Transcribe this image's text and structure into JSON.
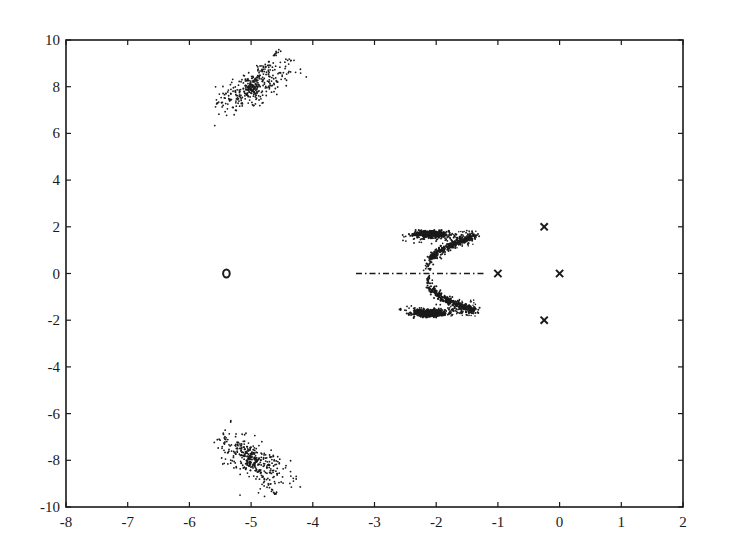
{
  "chart_data": {
    "type": "scatter",
    "title": "",
    "xlabel": "",
    "ylabel": "",
    "xlim": [
      -8,
      2
    ],
    "ylim": [
      -10,
      10
    ],
    "grid": false,
    "legend": null,
    "x_ticks": [
      -8,
      -7,
      -6,
      -5,
      -4,
      -3,
      -2,
      -1,
      0,
      1,
      2
    ],
    "y_ticks": [
      -10,
      -8,
      -6,
      -4,
      -2,
      0,
      2,
      4,
      6,
      8,
      10
    ],
    "x_tick_labels": [
      "-8",
      "-7",
      "-6",
      "-5",
      "-4",
      "-3",
      "-2",
      "-1",
      "0",
      "1",
      "2"
    ],
    "y_tick_labels": [
      "-10",
      "-8",
      "-6",
      "-4",
      "-2",
      "0",
      "2",
      "4",
      "6",
      "8",
      "10"
    ],
    "series": [
      {
        "name": "poles",
        "marker": "x",
        "points": [
          [
            -1.0,
            0.0
          ],
          [
            0.0,
            0.0
          ],
          [
            -0.25,
            2.0
          ],
          [
            -0.25,
            -2.0
          ]
        ]
      },
      {
        "name": "zero",
        "marker": "o",
        "points": [
          [
            -5.4,
            0.0
          ]
        ]
      },
      {
        "name": "upper-cloud",
        "marker": ".",
        "center": [
          -5.0,
          8.0
        ],
        "x_range": [
          -5.6,
          -4.1
        ],
        "y_range": [
          6.2,
          9.6
        ],
        "description": "scattered root cloud around (-5, 8), elongated toward upper right"
      },
      {
        "name": "lower-cloud",
        "marker": ".",
        "center": [
          -5.0,
          -8.0
        ],
        "x_range": [
          -5.6,
          -4.1
        ],
        "y_range": [
          -9.6,
          -6.2
        ],
        "description": "scattered root cloud around (-5, -8), elongated toward lower right"
      },
      {
        "name": "upper-butterfly",
        "marker": ".",
        "center": [
          -2.05,
          1.7
        ],
        "x_range": [
          -2.6,
          -1.3
        ],
        "y_range": [
          0.3,
          1.9
        ],
        "description": "dense band at y~1.7 from x=-2.4 to -1.8, diagonal arm from (-2.1,0.4) to (-1.4,1.6)"
      },
      {
        "name": "lower-butterfly",
        "marker": ".",
        "center": [
          -2.05,
          -1.7
        ],
        "x_range": [
          -2.6,
          -1.3
        ],
        "y_range": [
          -1.9,
          -0.3
        ],
        "description": "mirror image of upper butterfly about the real axis"
      },
      {
        "name": "real-axis-branch",
        "marker": "dash-dot",
        "points": [
          [
            -3.3,
            0.0
          ],
          [
            -1.2,
            0.0
          ]
        ],
        "description": "dash-dot segment along real axis from -3.3 to -1.2"
      }
    ]
  },
  "colors": {
    "axis": "#1a1a1a",
    "marker": "#1a1a1a",
    "background": "#ffffff"
  }
}
